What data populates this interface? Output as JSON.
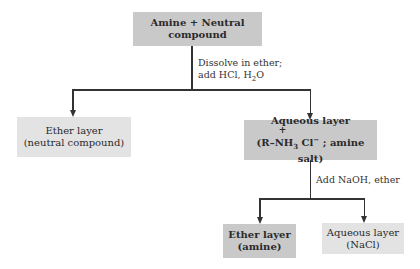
{
  "diagram": {
    "nodes": {
      "start": {
        "text": "Amine + Neutral compound"
      },
      "ether_neutral": {
        "line1": "Ether layer",
        "line2": "(neutral compound)"
      },
      "aqueous_salt": {
        "line1": "Aqueous layer",
        "charge": "+",
        "line2_prefix": "(R–NH",
        "line2_sub": "3",
        "line2_mid": " Cl",
        "line2_sup": "−",
        "line2_suffix": " ; amine salt)"
      },
      "ether_amine": {
        "line1": "Ether layer",
        "line2": "(amine)"
      },
      "aqueous_nacl": {
        "line1": "Aqueous layer",
        "line2": "(NaCl)"
      }
    },
    "edges": {
      "step1": {
        "line1": "Dissolve in ether;",
        "line2_prefix": "add HCl, H",
        "line2_sub": "2",
        "line2_suffix": "O"
      },
      "step2": {
        "text": "Add NaOH, ether"
      }
    },
    "colors": {
      "dark_box": "#c9c9c9",
      "light_box": "#e3e3e3",
      "line": "#333333"
    }
  }
}
